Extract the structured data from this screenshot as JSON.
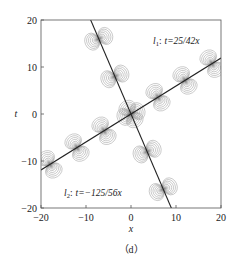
{
  "chart_data": {
    "type": "contour",
    "title": "",
    "caption": "（d）",
    "xlabel": "x",
    "ylabel": "t",
    "xlim": [
      -20,
      20
    ],
    "ylim": [
      -20,
      20
    ],
    "xticks": [
      -20,
      -10,
      0,
      10,
      20
    ],
    "yticks": [
      -20,
      -10,
      0,
      10,
      20
    ],
    "grid": false,
    "lines": [
      {
        "name": "l1",
        "label_sym": "l",
        "label_sub": "1",
        "equation": "t=25/42x",
        "slope": 0.5952,
        "x_range": [
          -20,
          20
        ]
      },
      {
        "name": "l2",
        "label_sym": "l",
        "label_sub": "2",
        "equation": "t=-125/56x",
        "slope": -2.232,
        "x_range": [
          -8.96,
          8.96
        ]
      }
    ],
    "contour_centers_along_l1_x": [
      -18,
      -12,
      -6,
      0,
      6,
      12,
      18
    ],
    "contour_centers_along_l2_t": [
      -16,
      -8,
      0,
      8,
      16
    ],
    "annotations": [
      {
        "text_sym": "l",
        "text_sub": "1",
        "text_eq": "t=25/42x",
        "x": 4.5,
        "t": 14.5
      },
      {
        "text_sym": "l",
        "text_sub": "2",
        "text_eq": "t=−125/56x",
        "x": -16.5,
        "t": -15.5
      }
    ],
    "colors": {
      "contour": "#9a9a9a",
      "line": "#222222",
      "core": "#555555"
    }
  },
  "labels": {
    "x_axis": "x",
    "y_axis": "t",
    "caption": "（d）",
    "l1_sym": "l",
    "l1_sub": "1",
    "l1_eq": "t=25/42x",
    "l2_sym": "l",
    "l2_sub": "2",
    "l2_eq": "t=−125/56x",
    "colon": ":",
    "xticks": [
      "−20",
      "−10",
      "0",
      "10",
      "20"
    ],
    "yticks": [
      "20",
      "10",
      "0",
      "−10",
      "−20"
    ]
  }
}
